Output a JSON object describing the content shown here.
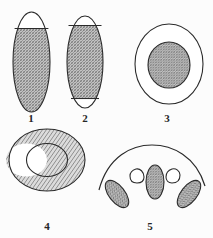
{
  "plate": {
    "title": "Cross-section diagrams plate",
    "background_color": "#fcfcfc",
    "outline_color": "#2b2b2b",
    "hatch_color": "#7a7a7a",
    "hatch_background": "#d9d9d9",
    "label_color": "#262626",
    "width": 213,
    "height": 238
  },
  "figures": [
    {
      "number": "1",
      "name": "vertical-ellipse-top-cap-unshaded",
      "description": "Tall vertical ellipse, hatched below a horizontal chord near the top; the top cap is left unshaded.",
      "shape": "ellipse",
      "fill": "cross-hatch",
      "chord_count": 1,
      "label": "1",
      "label_x": 31,
      "label_y": 112
    },
    {
      "number": "2",
      "name": "vertical-ellipse-two-caps-unshaded",
      "description": "Tall vertical ellipse, hatched between two horizontal chords; both the top and bottom caps are unshaded.",
      "shape": "ellipse",
      "fill": "cross-hatch",
      "chord_count": 2,
      "label": "2",
      "label_x": 85,
      "label_y": 112
    },
    {
      "number": "3",
      "name": "circle-with-hatched-core",
      "description": "Large unshaded outer circle containing a smaller concentric hatched circle.",
      "shape": "concentric-circles",
      "fill": "inner-hatched",
      "label": "3",
      "label_x": 167,
      "label_y": 112
    },
    {
      "number": "4",
      "name": "hatched-annulus",
      "description": "Thick hatched ring (annulus) with an unshaded circular centre.",
      "shape": "annulus",
      "fill": "ring-hatched",
      "label": "4",
      "label_x": 47,
      "label_y": 221
    },
    {
      "number": "5",
      "name": "arc-with-five-inclusions",
      "description": "Broad arc above five inclusions: three hatched ellipses (left tilted, centre upright, right tilted) and two small unshaded teardrops between them.",
      "shape": "arc-with-inclusions",
      "fill": "mixed",
      "inclusion_count": 5,
      "label": "5",
      "label_x": 150,
      "label_y": 221
    }
  ]
}
